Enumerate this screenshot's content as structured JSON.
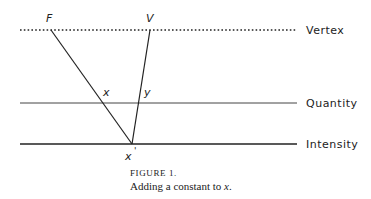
{
  "diagram": {
    "levels": [
      {
        "label": "Vertex",
        "style": "dotted"
      },
      {
        "label": "Quantity",
        "style": "thin"
      },
      {
        "label": "Intensity",
        "style": "thick"
      }
    ],
    "points": {
      "F": "F",
      "V": "V",
      "x": "x",
      "y": "y",
      "x_prime": "x",
      "prime": "'"
    }
  },
  "caption": {
    "figure_label": "FIGURE 1.",
    "text_prefix": "Adding a constant to ",
    "text_var": "x",
    "text_suffix": "."
  }
}
